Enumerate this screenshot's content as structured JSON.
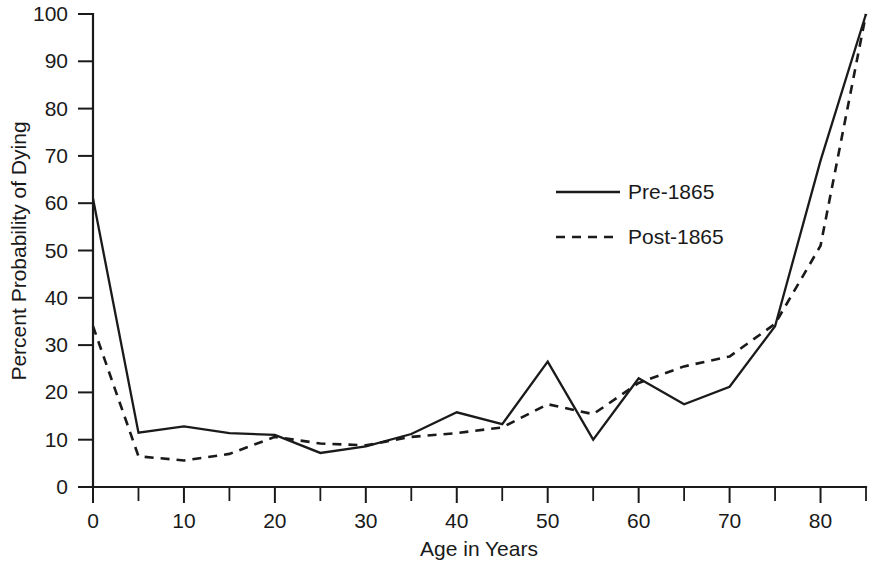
{
  "chart_data": {
    "type": "line",
    "title": "",
    "xlabel": "Age in Years",
    "ylabel": "Percent Probability of Dying",
    "xlim": [
      0,
      85
    ],
    "ylim": [
      0,
      100
    ],
    "grid": false,
    "legend_position": "inside-upper-right",
    "x": [
      0,
      5,
      10,
      15,
      20,
      25,
      30,
      35,
      40,
      45,
      50,
      55,
      60,
      65,
      70,
      75,
      80,
      85
    ],
    "xticks_major": [
      0,
      10,
      20,
      30,
      40,
      50,
      60,
      70,
      80
    ],
    "xticks_minor": [
      5,
      15,
      25,
      35,
      45,
      55,
      65,
      75,
      85
    ],
    "xtick_labels": [
      "0",
      "10",
      "20",
      "30",
      "40",
      "50",
      "60",
      "70",
      "80"
    ],
    "yticks": [
      0,
      10,
      20,
      30,
      40,
      50,
      60,
      70,
      80,
      90,
      100
    ],
    "ytick_labels": [
      "0",
      "10",
      "20",
      "30",
      "40",
      "50",
      "60",
      "70",
      "80",
      "90",
      "100"
    ],
    "series": [
      {
        "name": "Pre-1865",
        "style": "solid",
        "color": "#1a1a1a",
        "values": [
          61,
          11.5,
          12.8,
          11.4,
          11,
          7.2,
          8.6,
          11.2,
          15.8,
          13.3,
          26.5,
          10,
          23,
          17.5,
          21.2,
          34,
          69,
          100
        ]
      },
      {
        "name": "Post-1865",
        "style": "dashed",
        "color": "#1a1a1a",
        "values": [
          34,
          6.5,
          5.6,
          7,
          10.6,
          9.2,
          8.8,
          10.6,
          11.4,
          12.6,
          17.5,
          15.4,
          22,
          25.5,
          27.6,
          34.5,
          51,
          100
        ]
      }
    ]
  },
  "legend": {
    "entries": [
      {
        "label": "Pre-1865",
        "style": "solid"
      },
      {
        "label": "Post-1865",
        "style": "dashed"
      }
    ]
  }
}
